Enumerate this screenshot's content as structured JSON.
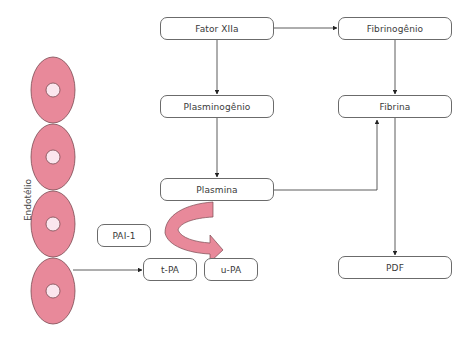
{
  "diagram": {
    "type": "fibrinolysis-pathway",
    "side_label": "Endotélio",
    "nodes": {
      "fator_xiia": "Fator XIIa",
      "fibrinogenio": "Fibrinogênio",
      "plasminogenio": "Plasminogênio",
      "fibrina": "Fibrina",
      "plasmina": "Plasmina",
      "pai1": "PAI-1",
      "tpa": "t-PA",
      "upa": "u-PA",
      "pdf": "PDF"
    },
    "edges": [
      {
        "from": "Fator XIIa",
        "to": "Fibrinogênio"
      },
      {
        "from": "Fator XIIa",
        "to": "Plasminogênio"
      },
      {
        "from": "Plasminogênio",
        "to": "Plasmina"
      },
      {
        "from": "Fibrinogênio",
        "to": "Fibrina"
      },
      {
        "from": "Plasmina",
        "to": "Fibrina"
      },
      {
        "from": "Fibrina",
        "to": "PDF"
      },
      {
        "from": "Endotélio",
        "to": "t-PA"
      },
      {
        "from": "PAI-1",
        "to": "t-PA / u-PA",
        "style": "curved-inhibition-arrow"
      }
    ],
    "cells": {
      "count": 4
    },
    "colors": {
      "cell_fill": "#e8899a",
      "cell_stroke": "#7a4a52",
      "nucleus_fill": "#fbe6ee",
      "curved_arrow_fill": "#e8899a",
      "line": "#333333",
      "box_border": "#6b6b6b"
    }
  }
}
